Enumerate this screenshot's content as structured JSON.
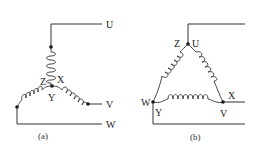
{
  "diagram": {
    "colors": {
      "line": "#333333",
      "text": "#222222",
      "background": "#ffffff"
    },
    "star": {
      "caption": "(a)",
      "terminals": {
        "U": "U",
        "V": "V",
        "W": "W"
      },
      "center_labels": {
        "Z": "Z",
        "X": "X",
        "Y": "Y"
      }
    },
    "delta": {
      "caption": "(b)",
      "terminals": {
        "U": "U",
        "V": "V",
        "W": "W"
      },
      "node_labels": {
        "Z": "Z",
        "X": "X",
        "Y": "Y"
      }
    }
  }
}
